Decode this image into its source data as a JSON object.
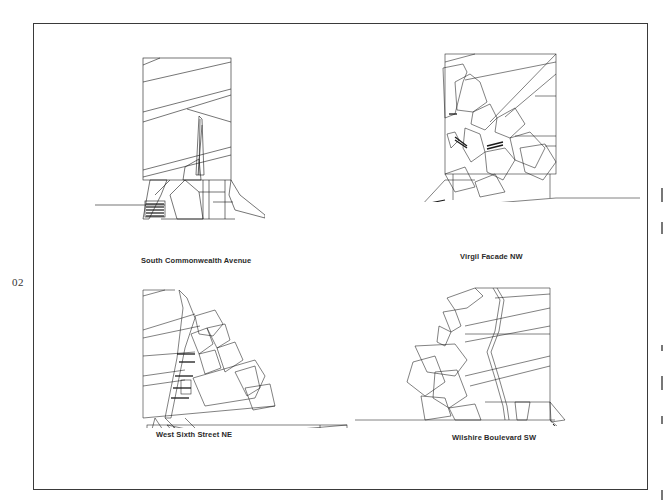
{
  "page": {
    "number": "02"
  },
  "elevations": [
    {
      "id": "south-commonwealth",
      "caption": "South Commonwealth Avenue"
    },
    {
      "id": "virgil-facade",
      "caption": "Virgil Facade NW"
    },
    {
      "id": "west-sixth",
      "caption": "West Sixth Street NE"
    },
    {
      "id": "wilshire",
      "caption": "Wilshire Boulevard SW"
    }
  ],
  "colors": {
    "line": "#1a1a1a",
    "frame": "#3a3a3a",
    "background": "#ffffff"
  }
}
